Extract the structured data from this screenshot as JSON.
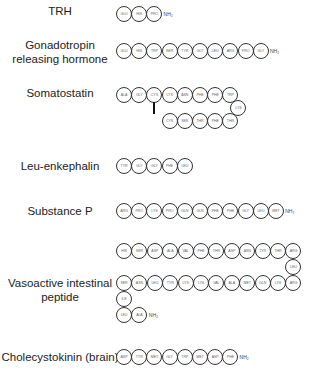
{
  "peptides": [
    {
      "name": "TRH",
      "label_x": 60,
      "label_y": 5,
      "rows": [
        {
          "x": 116,
          "y": 6,
          "residues": [
            "GLU",
            "HIS",
            "PRO"
          ]
        }
      ],
      "terminal": "NH2"
    },
    {
      "name": "Gonadotropin releasing hormone",
      "label_lines": [
        "Gonadotropin",
        "releasing hormone"
      ],
      "label_x": 60,
      "label_y": 41,
      "rows": [
        {
          "x": 116,
          "y": 43,
          "residues": [
            "GLU",
            "HIS",
            "TRP",
            "SER",
            "TYR",
            "GLY",
            "LEU",
            "ARG",
            "PRO",
            "GLY"
          ]
        }
      ],
      "terminal": "NH2"
    },
    {
      "name": "Somatostatin",
      "label_x": 60,
      "label_y": 86,
      "sequence": [
        "ALA",
        "GLY",
        "CYS",
        "LYS",
        "ASN",
        "PHE",
        "PHE",
        "TRP",
        "LYS",
        "THR",
        "PHE",
        "THR",
        "SER",
        "CYS"
      ],
      "disulfide": "CYS3-CYS14"
    },
    {
      "name": "Leu-enkephalin",
      "label_x": 60,
      "label_y": 159,
      "rows": [
        {
          "x": 116,
          "y": 158,
          "residues": [
            "TYR",
            "GLY",
            "GLY",
            "PHE",
            "LEU"
          ]
        }
      ]
    },
    {
      "name": "Substance P",
      "label_x": 60,
      "label_y": 204,
      "rows": [
        {
          "x": 116,
          "y": 203,
          "residues": [
            "ARG",
            "PRO",
            "LYS",
            "PRO",
            "GLN",
            "GLN",
            "PHE",
            "PHE",
            "GLY",
            "LEU",
            "MET"
          ]
        }
      ],
      "terminal": "NH2"
    },
    {
      "name": "Vasoactive intestinal peptide",
      "label_lines": [
        "Vasoactive intestinal",
        "peptide"
      ],
      "label_x": 60,
      "label_y": 280,
      "sequence": [
        "HIS",
        "SER",
        "ASP",
        "ALA",
        "VAL",
        "PHE",
        "THR",
        "ASP",
        "ASN",
        "TYR",
        "THR",
        "ARG",
        "LEU",
        "ARG",
        "LYS",
        "GLN",
        "MET",
        "ALA",
        "VAL",
        "LYS",
        "LYS",
        "TYR",
        "LEU",
        "ASN",
        "SER",
        "ILE",
        "LEU",
        "ALA"
      ],
      "terminal": "NH2"
    },
    {
      "name": "Cholecystokinin (brain)",
      "label_x": 60,
      "label_y": 350,
      "rows": [
        {
          "x": 116,
          "y": 349,
          "residues": [
            "ASP",
            "TYR",
            "MET",
            "GLY",
            "TRP",
            "MET",
            "ASP",
            "PHE"
          ]
        }
      ],
      "terminal": "NH2"
    }
  ],
  "labels": {
    "trh": "TRH",
    "gnrh_1": "Gonadotropin",
    "gnrh_2": "releasing hormone",
    "somatostatin": "Somatostatin",
    "enkephalin": "Leu-enkephalin",
    "substance_p": "Substance P",
    "vip_1": "Vasoactive intestinal",
    "vip_2": "peptide",
    "cck": "Cholecystokinin (brain)",
    "nh2": "NH₂"
  }
}
